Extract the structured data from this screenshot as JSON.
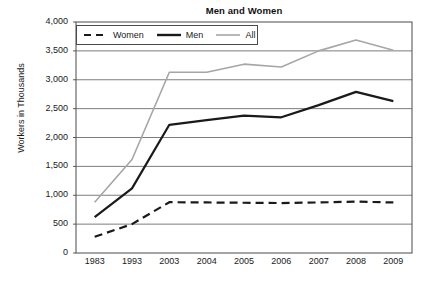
{
  "chart_data": {
    "type": "line",
    "title": "Men and Women",
    "xlabel": "",
    "ylabel": "Workers in Thousands",
    "categories": [
      "1983",
      "1993",
      "2003",
      "2004",
      "2005",
      "2006",
      "2007",
      "2008",
      "2009"
    ],
    "ylim": [
      0,
      4000
    ],
    "ytick_values": [
      0,
      500,
      1000,
      1500,
      2000,
      2500,
      3000,
      3500,
      4000
    ],
    "ytick_labels": [
      "0",
      "500",
      "1,000",
      "1,500",
      "2,000",
      "2,500",
      "3,000",
      "3,500",
      "4,000"
    ],
    "grid": true,
    "legend_position": "top-left-inside",
    "series": [
      {
        "name": "Women",
        "style": "dashed",
        "color": "#1a1a1a",
        "width": 2.2,
        "values": [
          280,
          500,
          880,
          875,
          870,
          865,
          875,
          890,
          875
        ]
      },
      {
        "name": "Men",
        "style": "solid",
        "color": "#1a1a1a",
        "width": 2.2,
        "values": [
          620,
          1120,
          2220,
          2300,
          2380,
          2350,
          2560,
          2790,
          2630
        ]
      },
      {
        "name": "All",
        "style": "solid",
        "color": "#a6a6a6",
        "width": 1.6,
        "values": [
          880,
          1620,
          3130,
          3130,
          3270,
          3220,
          3500,
          3690,
          3510
        ]
      }
    ]
  },
  "axes": {
    "frame_color": "#4a4a4a",
    "gridline_color": "#6e6e6e",
    "background": "#ffffff"
  },
  "legend": {
    "entries": [
      {
        "label": "Women",
        "icon": "dashed-line-swatch"
      },
      {
        "label": "Men",
        "icon": "solid-thick-line-swatch"
      },
      {
        "label": "All",
        "icon": "solid-thin-gray-line-swatch"
      }
    ]
  }
}
